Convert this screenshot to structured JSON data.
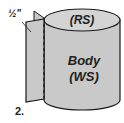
{
  "diagram": {
    "step_number": "2.",
    "top_label": "(RS)",
    "body_label_line1": "Body",
    "body_label_line2": "(WS)",
    "seam_allowance_label": "½\"",
    "colors": {
      "fill": "#c9c9c9",
      "stroke": "#1a1a1a",
      "background": "#ffffff"
    }
  }
}
